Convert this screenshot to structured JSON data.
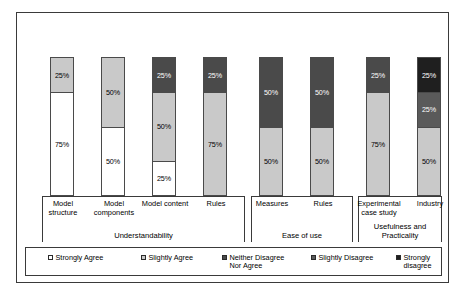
{
  "chart_data": {
    "type": "bar",
    "subtype": "stacked-percentage-column",
    "title": "",
    "subtitle": "",
    "xlabel": "",
    "ylabel": "",
    "ylim": [
      0,
      100
    ],
    "grid": false,
    "legend_position": "bottom",
    "categories": [
      "Model structure",
      "Model components",
      "Model content",
      "Rules",
      "Measures",
      "Rules",
      "Experimental case study",
      "Industry"
    ],
    "series": [
      {
        "name": "Strongly Agree",
        "color": "#ffffff",
        "values": [
          75,
          50,
          25,
          0,
          0,
          0,
          0,
          0
        ]
      },
      {
        "name": "Slightly Agree",
        "color": "#c9c9c9",
        "values": [
          25,
          50,
          50,
          75,
          50,
          50,
          75,
          50
        ]
      },
      {
        "name": "Neither Disagree Nor Agree",
        "color": "#4a4a4a",
        "values": [
          0,
          0,
          25,
          25,
          50,
          50,
          25,
          0
        ]
      },
      {
        "name": "Slightly Disagree",
        "color": "#5a5a5a",
        "values": [
          0,
          0,
          0,
          0,
          0,
          0,
          0,
          25
        ]
      },
      {
        "name": "Strongly disagree",
        "color": "#1f1f1f",
        "values": [
          0,
          0,
          0,
          0,
          0,
          0,
          0,
          25
        ]
      }
    ],
    "groups": [
      {
        "label": "Understandability",
        "categories": [
          "Model structure",
          "Model components",
          "Model content",
          "Rules"
        ]
      },
      {
        "label": "Ease of use",
        "categories": [
          "Measures",
          "Rules"
        ]
      },
      {
        "label": "Usefulness and Practicality",
        "categories": [
          "Experimental case study",
          "Industry"
        ]
      }
    ]
  },
  "bars": [
    {
      "category": "Model structure",
      "lines": [
        "Model",
        "structure"
      ],
      "segments": [
        {
          "series": "Slightly Agree",
          "value": 25,
          "label": "25%",
          "color": "#c9c9c9",
          "text": "dark"
        },
        {
          "series": "Strongly Agree",
          "value": 75,
          "label": "75%",
          "color": "#ffffff",
          "text": "dark"
        }
      ]
    },
    {
      "category": "Model components",
      "lines": [
        "Model",
        "components"
      ],
      "segments": [
        {
          "series": "Slightly Agree",
          "value": 50,
          "label": "50%",
          "color": "#c9c9c9",
          "text": "dark"
        },
        {
          "series": "Strongly Agree",
          "value": 50,
          "label": "50%",
          "color": "#ffffff",
          "text": "dark"
        }
      ]
    },
    {
      "category": "Model content",
      "lines": [
        "Model content",
        ""
      ],
      "segments": [
        {
          "series": "Neither Disagree Nor Agree",
          "value": 25,
          "label": "25%",
          "color": "#4a4a4a",
          "text": "light"
        },
        {
          "series": "Slightly Agree",
          "value": 50,
          "label": "50%",
          "color": "#c9c9c9",
          "text": "dark"
        },
        {
          "series": "Strongly Agree",
          "value": 25,
          "label": "25%",
          "color": "#ffffff",
          "text": "dark"
        }
      ]
    },
    {
      "category": "Rules",
      "lines": [
        "Rules",
        ""
      ],
      "segments": [
        {
          "series": "Neither Disagree Nor Agree",
          "value": 25,
          "label": "25%",
          "color": "#4a4a4a",
          "text": "light"
        },
        {
          "series": "Slightly Agree",
          "value": 75,
          "label": "75%",
          "color": "#c9c9c9",
          "text": "dark"
        }
      ]
    },
    {
      "category": "Measures",
      "lines": [
        "Measures",
        ""
      ],
      "segments": [
        {
          "series": "Neither Disagree Nor Agree",
          "value": 50,
          "label": "50%",
          "color": "#4a4a4a",
          "text": "light"
        },
        {
          "series": "Slightly Agree",
          "value": 50,
          "label": "50%",
          "color": "#c9c9c9",
          "text": "dark"
        }
      ]
    },
    {
      "category": "Rules",
      "lines": [
        "Rules",
        ""
      ],
      "segments": [
        {
          "series": "Neither Disagree Nor Agree",
          "value": 50,
          "label": "50%",
          "color": "#4a4a4a",
          "text": "light"
        },
        {
          "series": "Slightly Agree",
          "value": 50,
          "label": "50%",
          "color": "#c9c9c9",
          "text": "dark"
        }
      ]
    },
    {
      "category": "Experimental case study",
      "lines": [
        "Experimental",
        "case study"
      ],
      "segments": [
        {
          "series": "Neither Disagree Nor Agree",
          "value": 25,
          "label": "25%",
          "color": "#4a4a4a",
          "text": "light"
        },
        {
          "series": "Slightly Agree",
          "value": 75,
          "label": "75%",
          "color": "#c9c9c9",
          "text": "dark"
        }
      ]
    },
    {
      "category": "Industry",
      "lines": [
        "Industry",
        ""
      ],
      "segments": [
        {
          "series": "Strongly disagree",
          "value": 25,
          "label": "25%",
          "color": "#1f1f1f",
          "text": "light"
        },
        {
          "series": "Slightly Disagree",
          "value": 25,
          "label": "25%",
          "color": "#5a5a5a",
          "text": "light"
        },
        {
          "series": "Slightly Agree",
          "value": 50,
          "label": "50%",
          "color": "#c9c9c9",
          "text": "dark"
        }
      ]
    }
  ],
  "groups": [
    {
      "label": "Understandability"
    },
    {
      "label": "Ease of use"
    },
    {
      "label": "Usefulness and Practicality"
    }
  ],
  "legend": [
    {
      "label": "Strongly Agree",
      "color": "#ffffff"
    },
    {
      "label": "Slightly Agree",
      "color": "#c9c9c9"
    },
    {
      "label": "Neither Disagree\nNor Agree",
      "color": "#4a4a4a"
    },
    {
      "label": "Slightly Disagree",
      "color": "#5a5a5a"
    },
    {
      "label": "Strongly disagree",
      "color": "#1f1f1f"
    }
  ]
}
